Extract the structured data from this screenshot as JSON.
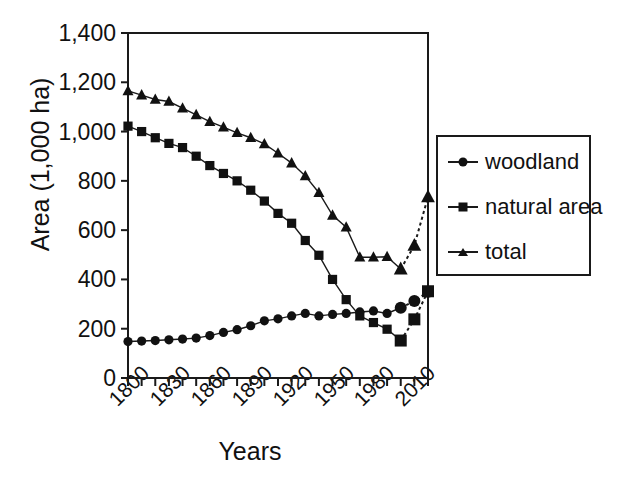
{
  "chart_data": {
    "type": "line",
    "title": "",
    "xlabel": "Years",
    "ylabel": "Area (1,000 ha)",
    "xlim": [
      1800,
      2020
    ],
    "ylim": [
      0,
      1400
    ],
    "grid": false,
    "legend_position": "right",
    "x": [
      1800,
      1810,
      1820,
      1830,
      1840,
      1850,
      1860,
      1870,
      1880,
      1890,
      1900,
      1910,
      1920,
      1930,
      1940,
      1950,
      1960,
      1970,
      1980,
      1990,
      2000,
      2010,
      2020
    ],
    "xticks": [
      1800,
      1830,
      1860,
      1890,
      1920,
      1950,
      1980,
      2010
    ],
    "xtick_labels": [
      "1800",
      "1830",
      "1860",
      "1890",
      "1920",
      "1950",
      "1980",
      "2010"
    ],
    "yticks": [
      0,
      200,
      400,
      600,
      800,
      1000,
      1200,
      1400
    ],
    "ytick_labels": [
      "0",
      "200",
      "400",
      "600",
      "800",
      "1,000",
      "1,200",
      "1,400"
    ],
    "series": [
      {
        "name": "woodland",
        "marker": "circle",
        "values": [
          148,
          150,
          152,
          155,
          158,
          162,
          172,
          185,
          196,
          212,
          232,
          240,
          252,
          262,
          252,
          258,
          262,
          268,
          272,
          262,
          285,
          312,
          350
        ],
        "dashed_from_index": 20
      },
      {
        "name": "natural area",
        "marker": "square",
        "values": [
          1022,
          1000,
          975,
          952,
          935,
          900,
          862,
          830,
          800,
          762,
          718,
          668,
          628,
          558,
          498,
          400,
          318,
          252,
          225,
          198,
          152,
          238,
          352
        ],
        "dashed_from_index": 20
      },
      {
        "name": "total",
        "marker": "triangle",
        "values": [
          1165,
          1148,
          1130,
          1122,
          1095,
          1068,
          1040,
          1018,
          995,
          975,
          950,
          912,
          872,
          820,
          752,
          660,
          612,
          490,
          490,
          492,
          442,
          538,
          735
        ],
        "dashed_from_index": 20
      }
    ]
  },
  "legend": {
    "items": [
      {
        "label": "woodland",
        "marker": "circle"
      },
      {
        "label": "natural area",
        "marker": "square"
      },
      {
        "label": "total",
        "marker": "triangle"
      }
    ]
  }
}
